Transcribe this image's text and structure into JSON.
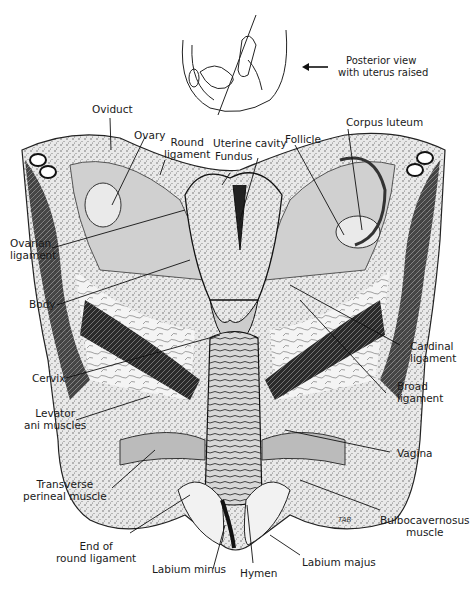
{
  "inset": {
    "caption_line1": "Posterior view",
    "caption_line2": "with uterus raised",
    "arrow": "left-arrow"
  },
  "labels": {
    "oviduct": "Oviduct",
    "ovary": "Ovary",
    "round_ligament_1": "Round",
    "round_ligament_2": "ligament",
    "uterine_cavity": "Uterine cavity",
    "fundus": "Fundus",
    "follicle": "Follicle",
    "corpus_luteum": "Corpus luteum",
    "ovarian_ligament_1": "Ovarian",
    "ovarian_ligament_2": "ligament",
    "body": "Body",
    "cervix": "Cervix",
    "levator_1": "Levator",
    "levator_2": "ani muscles",
    "transverse_1": "Transverse",
    "transverse_2": "perineal muscle",
    "end_round_1": "End of",
    "end_round_2": "round ligament",
    "labium_minus": "Labium minus",
    "hymen": "Hymen",
    "labium_majus": "Labium majus",
    "bulbo_1": "Bulbocavernosus",
    "bulbo_2": "muscle",
    "vagina": "Vagina",
    "broad_1": "Broad",
    "broad_2": "ligament",
    "cardinal_1": "Cardinal",
    "cardinal_2": "ligament"
  },
  "signature": "TAB"
}
